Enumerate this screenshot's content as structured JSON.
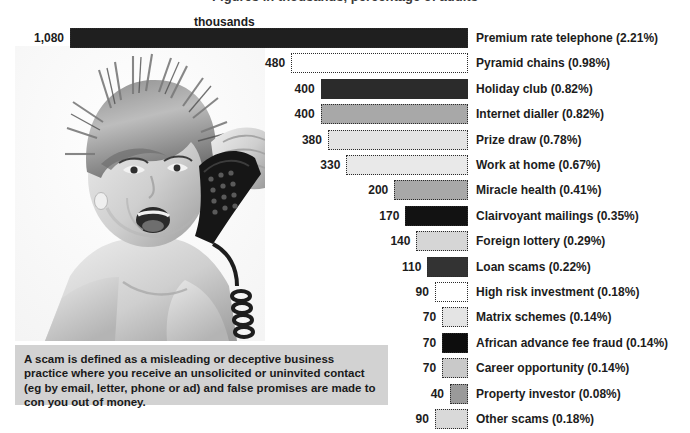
{
  "title_cut": "Figures in thousands, percentage of adults",
  "units_label": "thousands",
  "definition": "A scam is defined as a misleading or deceptive business practice where you receive an unsolicited or uninvited contact (eg by email, letter, phone or ad) and false promises are made to con you out of money.",
  "photo": {
    "alt": "Woman with short blonde spiky hair shouting into a corded telephone handset",
    "name": "woman-on-phone-photo"
  },
  "colors": {
    "very_dark": "#1f1f1f",
    "dark": "#2b2b2b",
    "black": "#0d0d0d",
    "mid_gray": "#a8a8a8",
    "gray": "#9a9a9a",
    "light_gray": "#d6d6d6",
    "lighter_gray": "#e4e4e4",
    "white": "#ffffff",
    "box_bg": "#d2d2d2",
    "border": "#2b2b2b"
  },
  "chart_data": {
    "type": "bar",
    "orientation": "horizontal",
    "title": "Figures in thousands, percentage of adults",
    "xlabel": "thousands",
    "ylabel": "",
    "grid": false,
    "legend": false,
    "axis_max": 1080,
    "bar_align": "right",
    "categories": [
      "Premium rate telephone",
      "Pyramid chains",
      "Holiday club",
      "Internet dialler",
      "Prize draw",
      "Work at home",
      "Miracle health",
      "Clairvoyant mailings",
      "Foreign lottery",
      "Loan scams",
      "High risk investment",
      "Matrix schemes",
      "African advance fee fraud",
      "Career opportunity",
      "Property investor",
      "Other scams"
    ],
    "values": [
      1080,
      480,
      400,
      400,
      380,
      330,
      200,
      170,
      140,
      110,
      90,
      70,
      70,
      70,
      40,
      90
    ],
    "value_labels": [
      "1,080",
      "480",
      "400",
      "400",
      "380",
      "330",
      "200",
      "170",
      "140",
      "110",
      "90",
      "70",
      "70",
      "70",
      "40",
      "90"
    ],
    "percents": [
      "2.21%",
      "0.98%",
      "0.82%",
      "0.82%",
      "0.78%",
      "0.67%",
      "0.41%",
      "0.35%",
      "0.29%",
      "0.22%",
      "0.18%",
      "0.14%",
      "0.14%",
      "0.14%",
      "0.08%",
      "0.18%"
    ],
    "labels": [
      "Premium rate telephone (2.21%)",
      "Pyramid chains (0.98%)",
      "Holiday club (0.82%)",
      "Internet dialler (0.82%)",
      "Prize draw (0.78%)",
      "Work at home (0.67%)",
      "Miracle health (0.41%)",
      "Clairvoyant mailings (0.35%)",
      "Foreign lottery (0.29%)",
      "Loan scams (0.22%)",
      "High risk investment (0.18%)",
      "Matrix schemes (0.14%)",
      "African advance fee fraud (0.14%)",
      "Career opportunity (0.14%)",
      "Property investor (0.08%)",
      "Other scams (0.18%)"
    ],
    "fills": [
      "#1f1f1f",
      "#ffffff",
      "#2b2b2b",
      "#a8a8a8",
      "#e4e4e4",
      "#e9e9e9",
      "#a8a8a8",
      "#121212",
      "#d6d6d6",
      "#333333",
      "#ffffff",
      "#e4e4e4",
      "#0d0d0d",
      "#c9c9c9",
      "#9a9a9a",
      "#d9d9d9"
    ]
  }
}
